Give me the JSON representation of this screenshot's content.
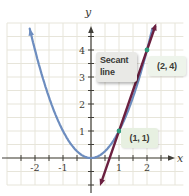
{
  "figure": {
    "labels": {
      "secant_line1": "Secant",
      "secant_line2": "line",
      "point1": "(1, 1)",
      "point2": "(2, 4)"
    },
    "colors": {
      "background": "#ffffff",
      "grid": "#e7e5da",
      "axis": "#413f39",
      "tick_text": "#3c3a34",
      "parabola": "#6d8dbf",
      "secant": "#6b2040",
      "point": "#2f9b7d",
      "secant_label_bg": "#e9e9e6",
      "point1_label_bg": "#e7f0e1",
      "point2_label_bg": "#eef4eb"
    }
  },
  "chart_data": {
    "type": "line",
    "title": "",
    "xlabel": "x",
    "ylabel": "y",
    "xlim": [
      -3.25,
      3.5
    ],
    "ylim": [
      -1.41,
      5.85
    ],
    "grid": true,
    "grid_x_range": [
      -3,
      3.3
    ],
    "grid_y_range": [
      -1,
      5
    ],
    "minor_step": 0.5,
    "x_ticks_labeled": [
      -2,
      -1,
      1,
      2
    ],
    "y_ticks_labeled": [
      1,
      2,
      3,
      4
    ],
    "series": [
      {
        "name": "parabola y = x^2",
        "kind": "function",
        "expr": "x^2",
        "x_start": -2.19,
        "x_end": 2.2,
        "color": "#6d8dbf",
        "sample_x": [
          -2,
          -1.5,
          -1,
          -0.5,
          0,
          0.5,
          1,
          1.5,
          2
        ],
        "sample_y": [
          4,
          2.25,
          1,
          0.25,
          0,
          0.25,
          1,
          2.25,
          4
        ]
      },
      {
        "name": "secant line y = 3x - 2",
        "kind": "segment",
        "slope": 3,
        "intercept": -2,
        "x_start": 0.36,
        "x_end": 2.29,
        "color": "#6b2040"
      }
    ],
    "points": [
      {
        "x": 1,
        "y": 1,
        "label": "(1, 1)",
        "color": "#2f9b7d"
      },
      {
        "x": 2,
        "y": 4,
        "label": "(2, 4)",
        "color": "#2f9b7d"
      }
    ],
    "annotations": [
      {
        "text": "Secant line",
        "target": "secant-line"
      },
      {
        "text": "(1, 1)",
        "x": 1,
        "y": 1
      },
      {
        "text": "(2, 4)",
        "x": 2,
        "y": 4
      }
    ]
  }
}
